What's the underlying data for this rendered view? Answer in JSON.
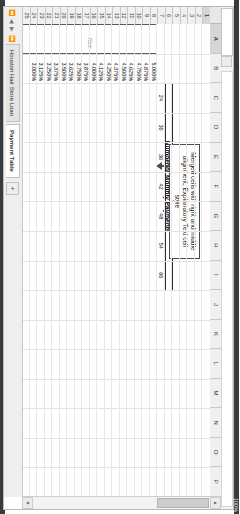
{
  "app": {
    "type": "spreadsheet",
    "orientation": "rotated-90-cw"
  },
  "columns": [
    "A",
    "B",
    "C",
    "D",
    "E",
    "F",
    "G",
    "H",
    "I",
    "J",
    "K",
    "L",
    "M",
    "N",
    "O",
    "P"
  ],
  "selected_column": "A",
  "rows": [
    "1",
    "2",
    "3",
    "4",
    "5",
    "6",
    "7",
    "8",
    "9",
    "10",
    "11",
    "12",
    "13",
    "14",
    "15",
    "16",
    "17",
    "18",
    "19",
    "20",
    "21",
    "22",
    "23",
    "24",
    "25"
  ],
  "selected_row": "1",
  "titles": {
    "main": "Payment Options",
    "sub": "Number of Monthly Payments"
  },
  "table": {
    "payment_counts": [
      "24",
      "30",
      "36",
      "42",
      "48",
      "54",
      "60"
    ],
    "interest_rates": [
      "5.000%",
      "4.875%",
      "4.750%",
      "4.625%",
      "4.500%",
      "4.375%",
      "4.250%",
      "4.125%",
      "4.000%",
      "3.875%",
      "3.750%",
      "3.625%",
      "3.500%",
      "3.375%",
      "3.250%",
      "3.125%",
      "3.000%"
    ]
  },
  "merged_cell": {
    "text": "Rate"
  },
  "callout": {
    "text": "Merged cells with right and middle alignment, Explanatory Text cell style"
  },
  "sheet_tabs": {
    "items": [
      {
        "label": "Houston Hair Store Loan",
        "active": false
      },
      {
        "label": "Payment Table",
        "active": true
      }
    ],
    "add_label": "+",
    "nav_first": "⏪",
    "nav_prev": "◀",
    "nav_next": "▶",
    "nav_last": "⏩"
  },
  "formula_bar": {
    "name_box_value": "",
    "formula_value": "",
    "fx_label": "fx"
  },
  "scrollbar": {
    "up_arrow": "▲",
    "down_arrow": "▼"
  },
  "view": {
    "zoom_label": "100%"
  },
  "colors": {
    "grid_line": "#e2e2e2",
    "header_bg": "#f0f0f0",
    "accent_border": "#2b2b2b",
    "callout_border": "#4a4a4a",
    "explanatory_text": "#7f7f7f"
  }
}
